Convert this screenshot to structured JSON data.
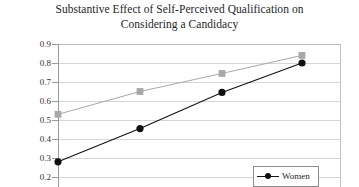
{
  "chart_data": {
    "type": "line",
    "title": "Substantive Effect of Self-Perceived Qualification on Considering a Candidacy",
    "title_line_1": "Substantive Effect of Self-Perceived Qualification on",
    "title_line_2": "Considering a Candidacy",
    "xlabel": "",
    "ylabel": "",
    "ylim": [
      0.2,
      0.9
    ],
    "ytick_labels": [
      "0.9",
      "0.8",
      "0.7",
      "0.6",
      "0.5",
      "0.4",
      "0.3",
      "0.2"
    ],
    "ytick_values": [
      0.9,
      0.8,
      0.7,
      0.6,
      0.5,
      0.4,
      0.3,
      0.2
    ],
    "grid": true,
    "legend_position": "bottom-right",
    "x": [
      1,
      2,
      3,
      4
    ],
    "series": [
      {
        "name": "",
        "color": "#a8a8a8",
        "marker": "square",
        "values": [
          0.53,
          0.65,
          0.745,
          0.84
        ]
      },
      {
        "name": "Women",
        "color": "#111111",
        "marker": "circle",
        "values": [
          0.28,
          0.455,
          0.645,
          0.8
        ]
      }
    ]
  },
  "legend": {
    "entries": [
      {
        "label": "Women"
      }
    ]
  },
  "axis": {
    "y_labels": [
      "0.9",
      "0.8",
      "0.7",
      "0.6",
      "0.5",
      "0.4",
      "0.3",
      "0.2"
    ]
  }
}
